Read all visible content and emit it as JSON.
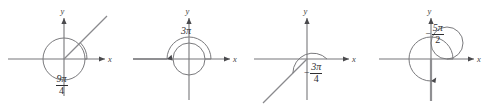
{
  "figure": {
    "panel_count": 4,
    "axis_labels": {
      "x": "x",
      "y": "y"
    },
    "colors": {
      "axis": "#77777a",
      "curve": "#7a7a7d",
      "ray": "#8a8a8d",
      "text": "#2e2e31",
      "background": "#ffffff"
    },
    "panels": [
      {
        "id": "panel-1",
        "label": {
          "sign": "",
          "numerator": "9π",
          "denominator": "4",
          "display": "9π/4",
          "is_fraction": true
        },
        "angle_radians": "9pi/4",
        "angle_degrees": 405,
        "direction": "counterclockwise",
        "turns": 1.125,
        "terminal_ray_degrees": 45,
        "label_position": {
          "x": 55,
          "y": 75
        }
      },
      {
        "id": "panel-2",
        "label": {
          "sign": "",
          "numerator": "3π",
          "denominator": "",
          "display": "3π",
          "is_fraction": false
        },
        "angle_radians": "3pi",
        "angle_degrees": 540,
        "direction": "counterclockwise",
        "turns": 1.5,
        "terminal_ray_degrees": 180,
        "label_position": {
          "x": 55,
          "y": 27
        }
      },
      {
        "id": "panel-3",
        "label": {
          "sign": "−",
          "numerator": "3π",
          "denominator": "4",
          "display": "−3π/4",
          "is_fraction": true
        },
        "angle_radians": "-3pi/4",
        "angle_degrees": -135,
        "direction": "clockwise",
        "turns": 0.375,
        "terminal_ray_degrees": 225,
        "label_position": {
          "x": 58,
          "y": 63
        }
      },
      {
        "id": "panel-4",
        "label": {
          "sign": "−",
          "numerator": "5π",
          "denominator": "2",
          "display": "−5π/2",
          "is_fraction": true
        },
        "angle_radians": "-5pi/2",
        "angle_degrees": -450,
        "direction": "clockwise",
        "turns": 1.25,
        "terminal_ray_degrees": 270,
        "label_position": {
          "x": 54,
          "y": 24
        }
      }
    ]
  }
}
